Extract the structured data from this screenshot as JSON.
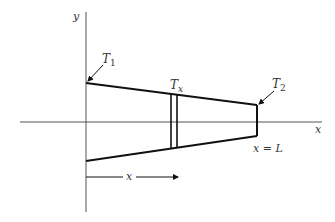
{
  "diagram": {
    "axes": {
      "x_label": "x",
      "y_label": "y"
    },
    "labels": {
      "t1_main": "T",
      "t1_sub": "1",
      "tx_main": "T",
      "tx_sub": "x",
      "t2_main": "T",
      "t2_sub": "2",
      "end_label": "x = L",
      "distance_label": "x"
    },
    "colors": {
      "stroke": "#111111",
      "axis": "#555555",
      "text": "#333333"
    }
  }
}
